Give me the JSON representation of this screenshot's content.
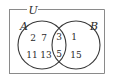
{
  "figure": {
    "type": "venn-diagram",
    "title": "",
    "universe": {
      "label": "U",
      "border_color": "#8a8a8a"
    },
    "sets": [
      {
        "key": "A",
        "label": "A",
        "stroke_color": "#3a3a3a"
      },
      {
        "key": "B",
        "label": "B",
        "stroke_color": "#3a3a3a"
      }
    ],
    "regions": {
      "a_only": {
        "name": "A only",
        "elements": [
          "2",
          "7",
          "11",
          "13"
        ]
      },
      "intersection": {
        "name": "A intersect B",
        "elements": [
          "3",
          "5"
        ]
      },
      "b_only": {
        "name": "B only",
        "elements": [
          "1",
          "15"
        ]
      },
      "outside": {
        "name": "outside A and B",
        "elements": []
      }
    },
    "text_color": "#2b2b2b",
    "background_color": "#ffffff"
  }
}
